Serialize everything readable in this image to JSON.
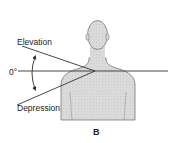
{
  "figure": {
    "panel_label": "B",
    "labels": {
      "elevation": "Elevation",
      "zero": "0°",
      "depression": "Depression"
    },
    "colors": {
      "body_fill": "#dcdcdc",
      "body_stipple": "#b9b9b9",
      "outline": "#555555",
      "line": "#333333",
      "text": "#222222"
    }
  }
}
